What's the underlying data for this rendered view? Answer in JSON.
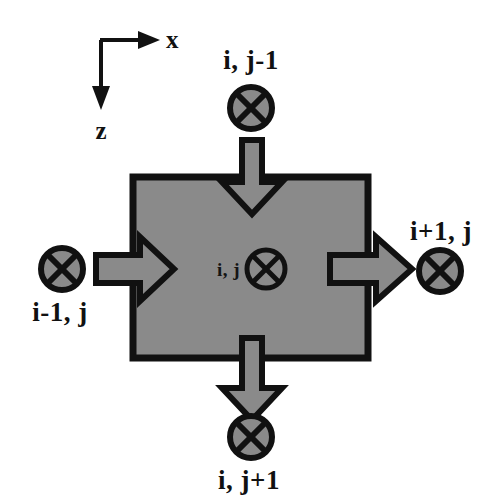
{
  "figure": {
    "type": "finite-difference-cell-diagram",
    "background_color": "#ffffff",
    "cell_fill_color": "#8a8a8a",
    "stroke_color": "#111111",
    "arrow_fill_color": "#8a8a8a"
  },
  "axes": {
    "x_label": "x",
    "z_label": "z",
    "origin_note": "",
    "x_direction": "right",
    "z_direction": "down"
  },
  "nodes": {
    "top": {
      "label": "i, j-1",
      "symbol": "circled-x",
      "label_position": "above"
    },
    "left": {
      "label": "i-1, j",
      "symbol": "circled-x",
      "label_position": "below"
    },
    "center": {
      "label": "i, j",
      "symbol": "circled-x",
      "label_position": "left"
    },
    "right": {
      "label": "i+1, j",
      "symbol": "circled-x",
      "label_position": "above"
    },
    "bottom": {
      "label": "i, j+1",
      "symbol": "circled-x",
      "label_position": "below"
    }
  },
  "arrows": [
    {
      "name": "inflow-top",
      "direction": "down",
      "from": "i, j-1",
      "to": "i, j"
    },
    {
      "name": "inflow-left",
      "direction": "right",
      "from": "i-1, j",
      "to": "i, j"
    },
    {
      "name": "outflow-right",
      "direction": "right",
      "from": "i, j",
      "to": "i+1, j"
    },
    {
      "name": "outflow-bottom",
      "direction": "down",
      "from": "i, j",
      "to": "i, j+1"
    }
  ],
  "cell": {
    "name": "control-volume",
    "x": 133,
    "y": 177,
    "width": 235,
    "height": 181
  }
}
